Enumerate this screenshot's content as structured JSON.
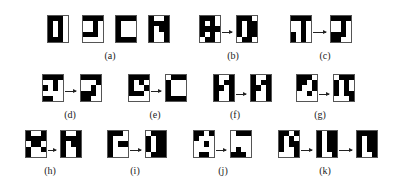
{
  "figure": {
    "panels": [
      {
        "id": "a",
        "label": "(a)",
        "label_pos": [
          110,
          50
        ],
        "glyphs": [
          {
            "x": 47,
            "y": 15,
            "bits": "1110101010101010111 0"
          },
          {
            "x": 82,
            "y": 15,
            "bits": "11110010001011100000"
          },
          {
            "x": 115,
            "y": 15,
            "bits": "11111000100010001111"
          },
          {
            "x": 148,
            "y": 15,
            "bits": "10011111101110011001"
          }
        ],
        "arrows": []
      },
      {
        "id": "b",
        "label": "(b)",
        "label_pos": [
          233,
          50
        ],
        "glyphs": [
          {
            "x": 199,
            "y": 15,
            "bits": "11101010111110100110"
          },
          {
            "x": 236,
            "y": 15,
            "bits": "11101011101110110110"
          }
        ],
        "arrows": [
          [
            222,
            32,
            235
          ]
        ]
      },
      {
        "id": "c",
        "label": "(c)",
        "label_pos": [
          325,
          50
        ],
        "glyphs": [
          {
            "x": 290,
            "y": 15,
            "bits": "11110010001010101010"
          },
          {
            "x": 330,
            "y": 15,
            "bits": "11110010001011101100"
          }
        ],
        "arrows": [
          [
            313,
            32,
            329
          ]
        ]
      },
      {
        "id": "d",
        "label": "(d)",
        "label_pos": [
          70,
          109
        ],
        "glyphs": [
          {
            "x": 42,
            "y": 74,
            "bits": "11110010101000001100"
          },
          {
            "x": 80,
            "y": 74,
            "bits": "11110001001011101100"
          }
        ],
        "arrows": [
          [
            65,
            91,
            79
          ]
        ]
      },
      {
        "id": "e",
        "label": "(e)",
        "label_pos": [
          155,
          109
        ],
        "glyphs": [
          {
            "x": 128,
            "y": 74,
            "bits": "11111010100111100000"
          },
          {
            "x": 165,
            "y": 74,
            "bits": "01111000100010001111"
          }
        ],
        "arrows": [
          [
            151,
            91,
            164
          ]
        ]
      },
      {
        "id": "f",
        "label": "(f)",
        "label_pos": [
          235,
          109
        ],
        "glyphs": [
          {
            "x": 213,
            "y": 74,
            "bits": "10011011110110011001"
          },
          {
            "x": 250,
            "y": 74,
            "bits": "10011011110110011001"
          }
        ],
        "arrows": [
          [
            236,
            94,
            249
          ]
        ]
      },
      {
        "id": "g",
        "label": "(g)",
        "label_pos": [
          320,
          109
        ],
        "glyphs": [
          {
            "x": 296,
            "y": 74,
            "bits": "11101101100100100000"
          },
          {
            "x": 333,
            "y": 74,
            "bits": "01111010101010110001"
          }
        ],
        "arrows": [
          [
            319,
            94,
            332
          ]
        ]
      },
      {
        "id": "h",
        "label": "(h)",
        "label_pos": [
          50,
          165
        ],
        "glyphs": [
          {
            "x": 25,
            "y": 130,
            "bits": "10011111011010011000"
          },
          {
            "x": 60,
            "y": 130,
            "bits": "10011111101110011001"
          }
        ],
        "arrows": [
          [
            48,
            150,
            59
          ]
        ]
      },
      {
        "id": "i",
        "label": "(i)",
        "label_pos": [
          135,
          165
        ],
        "glyphs": [
          {
            "x": 107,
            "y": 130,
            "bits": "11101000101110001000"
          },
          {
            "x": 145,
            "y": 130,
            "bits": "01111011101110110111"
          }
        ],
        "arrows": [
          [
            130,
            150,
            144
          ]
        ]
      },
      {
        "id": "j",
        "label": "(j)",
        "label_pos": [
          223,
          165
        ],
        "glyphs": [
          {
            "x": 193,
            "y": 130,
            "bits": "11011000001000000110"
          },
          {
            "x": 230,
            "y": 130,
            "bits": "01110000000001001110"
          }
        ],
        "arrows": [
          [
            216,
            150,
            229
          ]
        ]
      },
      {
        "id": "k",
        "label": "(k)",
        "label_pos": [
          325,
          165
        ],
        "glyphs": [
          {
            "x": 278,
            "y": 130,
            "bits": "11011010101110010001"
          },
          {
            "x": 316,
            "y": 130,
            "bits": "10111011101110111001"
          },
          {
            "x": 356,
            "y": 130,
            "bits": "11111011101110111001"
          }
        ],
        "arrows": [
          [
            301,
            150,
            315
          ],
          [
            339,
            150,
            355
          ]
        ]
      }
    ]
  }
}
